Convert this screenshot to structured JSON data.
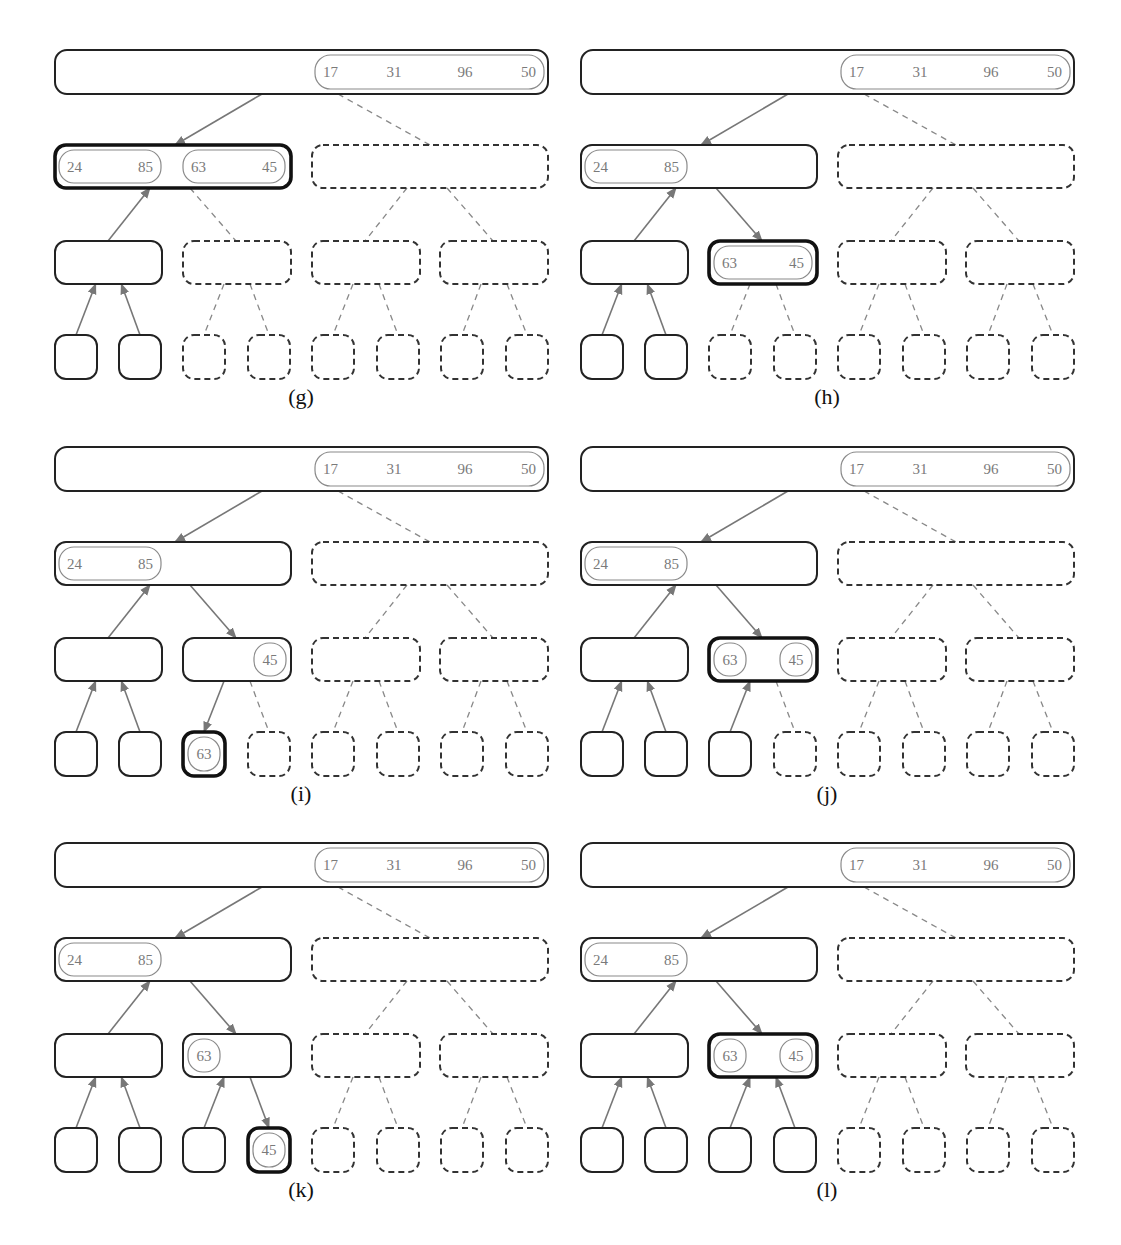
{
  "figure": {
    "colors": {
      "node_stroke": "#222222",
      "active_stroke": "#111111",
      "value_text": "#7a7a7a",
      "edge": "#777777",
      "background": "#ffffff"
    },
    "panels": [
      {
        "id": "g",
        "caption": "(g)",
        "root": {
          "runs": [
            {
              "values": [
                "17",
                "31",
                "96",
                "50"
              ]
            }
          ]
        },
        "level1": [
          {
            "state": "active",
            "runs": [
              {
                "values": [
                  "24",
                  "85"
                ]
              },
              {
                "values": [
                  "63",
                  "45"
                ]
              }
            ]
          },
          {
            "state": "dashed",
            "runs": []
          }
        ],
        "level2": [
          {
            "state": "solid",
            "runs": []
          },
          {
            "state": "dashed",
            "runs": []
          },
          {
            "state": "dashed",
            "runs": []
          },
          {
            "state": "dashed",
            "runs": []
          }
        ],
        "leaves": [
          {
            "state": "solid",
            "value": null
          },
          {
            "state": "solid",
            "value": null
          },
          {
            "state": "dashed",
            "value": null
          },
          {
            "state": "dashed",
            "value": null
          },
          {
            "state": "dashed",
            "value": null
          },
          {
            "state": "dashed",
            "value": null
          },
          {
            "state": "dashed",
            "value": null
          },
          {
            "state": "dashed",
            "value": null
          }
        ],
        "edges": {
          "root_l1": [
            "down",
            "dashed"
          ],
          "l1_l2": [
            "up",
            "dashed",
            "dashed",
            "dashed"
          ],
          "l2_leaf": [
            "up",
            "up",
            "dashed",
            "dashed",
            "dashed",
            "dashed",
            "dashed",
            "dashed"
          ]
        }
      },
      {
        "id": "h",
        "caption": "(h)",
        "root": {
          "runs": [
            {
              "values": [
                "17",
                "31",
                "96",
                "50"
              ]
            }
          ]
        },
        "level1": [
          {
            "state": "solid",
            "runs": [
              {
                "values": [
                  "24",
                  "85"
                ]
              }
            ]
          },
          {
            "state": "dashed",
            "runs": []
          }
        ],
        "level2": [
          {
            "state": "solid",
            "runs": []
          },
          {
            "state": "active",
            "runs": [
              {
                "values": [
                  "63",
                  "45"
                ],
                "full": true
              }
            ]
          },
          {
            "state": "dashed",
            "runs": []
          },
          {
            "state": "dashed",
            "runs": []
          }
        ],
        "leaves": [
          {
            "state": "solid",
            "value": null
          },
          {
            "state": "solid",
            "value": null
          },
          {
            "state": "dashed",
            "value": null
          },
          {
            "state": "dashed",
            "value": null
          },
          {
            "state": "dashed",
            "value": null
          },
          {
            "state": "dashed",
            "value": null
          },
          {
            "state": "dashed",
            "value": null
          },
          {
            "state": "dashed",
            "value": null
          }
        ],
        "edges": {
          "root_l1": [
            "down",
            "dashed"
          ],
          "l1_l2": [
            "up",
            "down",
            "dashed",
            "dashed"
          ],
          "l2_leaf": [
            "up",
            "up",
            "dashed",
            "dashed",
            "dashed",
            "dashed",
            "dashed",
            "dashed"
          ]
        }
      },
      {
        "id": "i",
        "caption": "(i)",
        "root": {
          "runs": [
            {
              "values": [
                "17",
                "31",
                "96",
                "50"
              ]
            }
          ]
        },
        "level1": [
          {
            "state": "solid",
            "runs": [
              {
                "values": [
                  "24",
                  "85"
                ]
              }
            ]
          },
          {
            "state": "dashed",
            "runs": []
          }
        ],
        "level2": [
          {
            "state": "solid",
            "runs": []
          },
          {
            "state": "solid",
            "runs": [
              {
                "values": [
                  "45"
                ],
                "align": "right"
              }
            ]
          },
          {
            "state": "dashed",
            "runs": []
          },
          {
            "state": "dashed",
            "runs": []
          }
        ],
        "leaves": [
          {
            "state": "solid",
            "value": null
          },
          {
            "state": "solid",
            "value": null
          },
          {
            "state": "active",
            "value": "63"
          },
          {
            "state": "dashed",
            "value": null
          },
          {
            "state": "dashed",
            "value": null
          },
          {
            "state": "dashed",
            "value": null
          },
          {
            "state": "dashed",
            "value": null
          },
          {
            "state": "dashed",
            "value": null
          }
        ],
        "edges": {
          "root_l1": [
            "down",
            "dashed"
          ],
          "l1_l2": [
            "up",
            "down",
            "dashed",
            "dashed"
          ],
          "l2_leaf": [
            "up",
            "up",
            "down",
            "dashed",
            "dashed",
            "dashed",
            "dashed",
            "dashed"
          ]
        }
      },
      {
        "id": "j",
        "caption": "(j)",
        "root": {
          "runs": [
            {
              "values": [
                "17",
                "31",
                "96",
                "50"
              ]
            }
          ]
        },
        "level1": [
          {
            "state": "solid",
            "runs": [
              {
                "values": [
                  "24",
                  "85"
                ]
              }
            ]
          },
          {
            "state": "dashed",
            "runs": []
          }
        ],
        "level2": [
          {
            "state": "solid",
            "runs": []
          },
          {
            "state": "active",
            "runs": [
              {
                "values": [
                  "63"
                ],
                "align": "left"
              },
              {
                "values": [
                  "45"
                ],
                "align": "right"
              }
            ]
          },
          {
            "state": "dashed",
            "runs": []
          },
          {
            "state": "dashed",
            "runs": []
          }
        ],
        "leaves": [
          {
            "state": "solid",
            "value": null
          },
          {
            "state": "solid",
            "value": null
          },
          {
            "state": "solid",
            "value": null
          },
          {
            "state": "dashed",
            "value": null
          },
          {
            "state": "dashed",
            "value": null
          },
          {
            "state": "dashed",
            "value": null
          },
          {
            "state": "dashed",
            "value": null
          },
          {
            "state": "dashed",
            "value": null
          }
        ],
        "edges": {
          "root_l1": [
            "down",
            "dashed"
          ],
          "l1_l2": [
            "up",
            "down",
            "dashed",
            "dashed"
          ],
          "l2_leaf": [
            "up",
            "up",
            "up",
            "dashed",
            "dashed",
            "dashed",
            "dashed",
            "dashed"
          ]
        }
      },
      {
        "id": "k",
        "caption": "(k)",
        "root": {
          "runs": [
            {
              "values": [
                "17",
                "31",
                "96",
                "50"
              ]
            }
          ]
        },
        "level1": [
          {
            "state": "solid",
            "runs": [
              {
                "values": [
                  "24",
                  "85"
                ]
              }
            ]
          },
          {
            "state": "dashed",
            "runs": []
          }
        ],
        "level2": [
          {
            "state": "solid",
            "runs": []
          },
          {
            "state": "solid",
            "runs": [
              {
                "values": [
                  "63"
                ],
                "align": "left"
              }
            ]
          },
          {
            "state": "dashed",
            "runs": []
          },
          {
            "state": "dashed",
            "runs": []
          }
        ],
        "leaves": [
          {
            "state": "solid",
            "value": null
          },
          {
            "state": "solid",
            "value": null
          },
          {
            "state": "solid",
            "value": null
          },
          {
            "state": "active",
            "value": "45"
          },
          {
            "state": "dashed",
            "value": null
          },
          {
            "state": "dashed",
            "value": null
          },
          {
            "state": "dashed",
            "value": null
          },
          {
            "state": "dashed",
            "value": null
          }
        ],
        "edges": {
          "root_l1": [
            "down",
            "dashed"
          ],
          "l1_l2": [
            "up",
            "down",
            "dashed",
            "dashed"
          ],
          "l2_leaf": [
            "up",
            "up",
            "up",
            "down",
            "dashed",
            "dashed",
            "dashed",
            "dashed"
          ]
        }
      },
      {
        "id": "l",
        "caption": "(l)",
        "root": {
          "runs": [
            {
              "values": [
                "17",
                "31",
                "96",
                "50"
              ]
            }
          ]
        },
        "level1": [
          {
            "state": "solid",
            "runs": [
              {
                "values": [
                  "24",
                  "85"
                ]
              }
            ]
          },
          {
            "state": "dashed",
            "runs": []
          }
        ],
        "level2": [
          {
            "state": "solid",
            "runs": []
          },
          {
            "state": "active",
            "runs": [
              {
                "values": [
                  "63"
                ],
                "align": "left"
              },
              {
                "values": [
                  "45"
                ],
                "align": "right"
              }
            ]
          },
          {
            "state": "dashed",
            "runs": []
          },
          {
            "state": "dashed",
            "runs": []
          }
        ],
        "leaves": [
          {
            "state": "solid",
            "value": null
          },
          {
            "state": "solid",
            "value": null
          },
          {
            "state": "solid",
            "value": null
          },
          {
            "state": "solid",
            "value": null
          },
          {
            "state": "dashed",
            "value": null
          },
          {
            "state": "dashed",
            "value": null
          },
          {
            "state": "dashed",
            "value": null
          },
          {
            "state": "dashed",
            "value": null
          }
        ],
        "edges": {
          "root_l1": [
            "down",
            "dashed"
          ],
          "l1_l2": [
            "up",
            "down",
            "dashed",
            "dashed"
          ],
          "l2_leaf": [
            "up",
            "up",
            "up",
            "up",
            "dashed",
            "dashed",
            "dashed",
            "dashed"
          ]
        }
      }
    ]
  }
}
